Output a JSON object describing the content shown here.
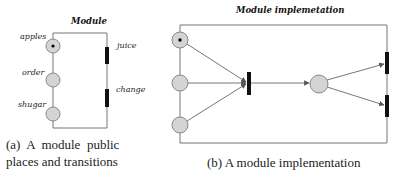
{
  "figure_a": {
    "title": "Module",
    "places": [
      {
        "label": "apples",
        "has_token": true
      },
      {
        "label": "order",
        "has_token": false
      },
      {
        "label": "shugar",
        "has_token": false
      }
    ],
    "transitions": [
      {
        "label": "juice"
      },
      {
        "label": "change"
      }
    ],
    "caption_line1": "(a)  A  module  public",
    "caption_line2": "places and transitions"
  },
  "figure_b": {
    "title": "Module implemetation",
    "caption": "(b) A module implementation"
  },
  "colors": {
    "place_fill": "#d4d4d4",
    "transition_fill": "#111111",
    "frame_stroke": "#777777"
  }
}
